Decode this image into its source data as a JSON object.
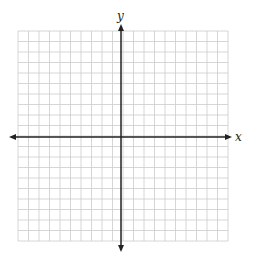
{
  "diagram": {
    "type": "coordinate-plane",
    "x_axis_label": "x",
    "y_axis_label": "y",
    "grid": {
      "columns": 20,
      "rows": 20,
      "left": 18,
      "top": 31,
      "cell_size": 10.5,
      "line_color": "#cccccc"
    },
    "axes": {
      "origin_x": 121,
      "origin_y": 137,
      "x_start": 9,
      "x_end": 232,
      "y_start": 24,
      "y_end": 252,
      "color": "#222222"
    }
  }
}
